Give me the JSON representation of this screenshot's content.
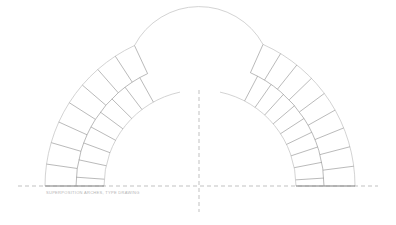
{
  "drawing": {
    "title": "Double arch with voussoir rings",
    "stroke_colors": {
      "block_lines": "#8c8c8c",
      "outer_arcs": "#c8c8c8",
      "dashed_axes": "#a8a8a8"
    },
    "center": {
      "x": 200,
      "y": 186
    },
    "rings": {
      "inner_r": 96,
      "middle_r": 124,
      "outer_r": 155
    },
    "left_arch": {
      "start_deg": 180,
      "end_deg": 115,
      "inner_end_deg": 102,
      "blocks": 8
    },
    "right_arch": {
      "start_deg": 0,
      "end_deg": 66,
      "inner_end_deg": 78,
      "blocks": 9
    },
    "crown_arc": {
      "cx": 199,
      "cy": 75,
      "r": 73
    },
    "baseline": {
      "y": 186,
      "x1": 18,
      "x2": 378
    },
    "center_axis": {
      "x": 199,
      "y1": 90,
      "y2": 212
    },
    "caption": "SUPERPOSITION ARCHES, TYPE DRAWING"
  }
}
